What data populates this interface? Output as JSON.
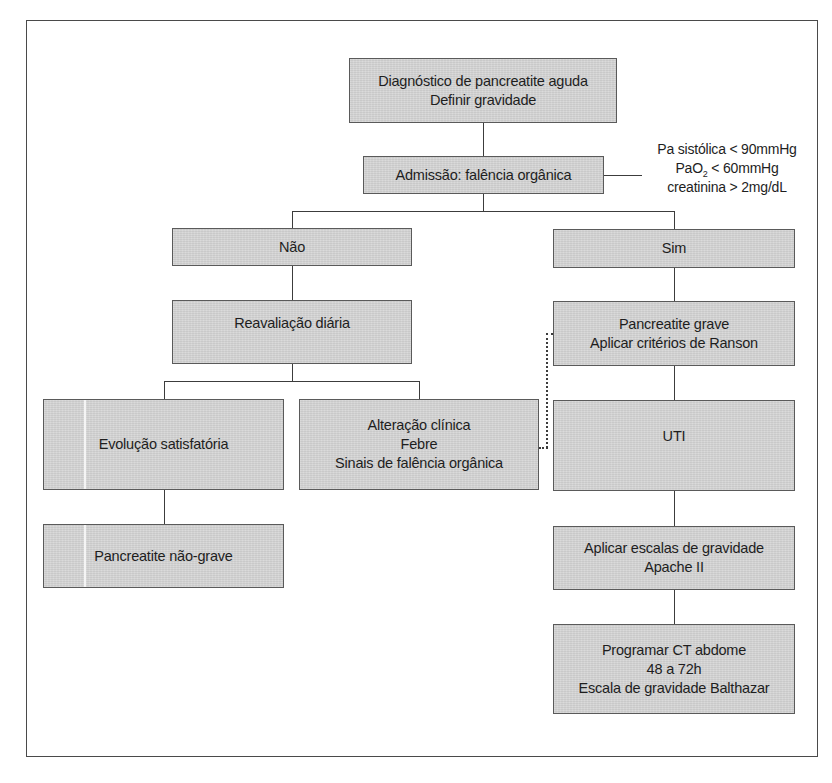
{
  "diagram": {
    "type": "flowchart",
    "nodes": {
      "diagnosis": {
        "lines": [
          "Diagnóstico de pancreatite aguda",
          "Definir gravidade"
        ]
      },
      "admission": {
        "lines": [
          "Admissão: falência orgânica"
        ]
      },
      "criteria": {
        "line1": "Pa sistólica < 90mmHg",
        "line2_prefix": "PaO",
        "line2_sub": "2",
        "line2_suffix": " < 60mmHg",
        "line3": "creatinina > 2mg/dL"
      },
      "no": {
        "lines": [
          "Não"
        ]
      },
      "yes": {
        "lines": [
          "Sim"
        ]
      },
      "daily_reassessment": {
        "lines": [
          "Reavaliação diária"
        ]
      },
      "severe": {
        "lines": [
          "Pancreatite grave",
          "Aplicar critérios de Ranson"
        ]
      },
      "satisfactory": {
        "lines": [
          "Evolução satisfatória"
        ]
      },
      "clinical_change": {
        "lines": [
          "Alteração clínica",
          "Febre",
          "Sinais de falência orgânica"
        ]
      },
      "icu": {
        "lines": [
          "UTI"
        ]
      },
      "non_severe": {
        "lines": [
          "Pancreatite não-grave"
        ]
      },
      "severity_scales": {
        "lines": [
          "Aplicar escalas de gravidade",
          "Apache II"
        ]
      },
      "ct_schedule": {
        "lines": [
          "Programar CT abdome",
          "48 a 72h",
          "Escala de gravidade Balthazar"
        ]
      }
    },
    "edges": [
      {
        "from": "diagnosis",
        "to": "admission",
        "style": "solid"
      },
      {
        "from": "admission",
        "to": "criteria",
        "style": "solid"
      },
      {
        "from": "admission",
        "to": "no",
        "style": "solid"
      },
      {
        "from": "admission",
        "to": "yes",
        "style": "solid"
      },
      {
        "from": "no",
        "to": "daily_reassessment",
        "style": "solid"
      },
      {
        "from": "yes",
        "to": "severe",
        "style": "solid"
      },
      {
        "from": "daily_reassessment",
        "to": "satisfactory",
        "style": "solid"
      },
      {
        "from": "daily_reassessment",
        "to": "clinical_change",
        "style": "solid"
      },
      {
        "from": "clinical_change",
        "to": "severe",
        "style": "dotted"
      },
      {
        "from": "severe",
        "to": "icu",
        "style": "solid"
      },
      {
        "from": "satisfactory",
        "to": "non_severe",
        "style": "solid"
      },
      {
        "from": "icu",
        "to": "severity_scales",
        "style": "solid"
      },
      {
        "from": "severity_scales",
        "to": "ct_schedule",
        "style": "solid"
      }
    ],
    "colors": {
      "box_fill": "#d4d4d4",
      "box_border": "#5a5a5a",
      "line": "#3c3c3c",
      "frame": "#4a4a4a"
    }
  }
}
